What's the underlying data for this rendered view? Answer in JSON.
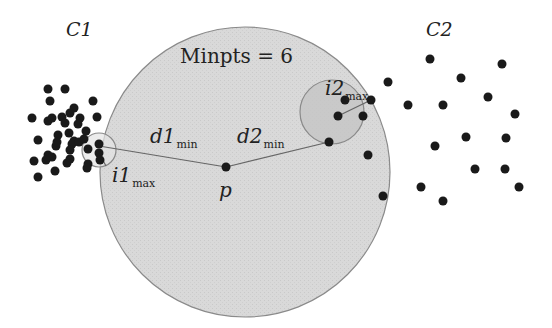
{
  "labels": {
    "cluster1": "C1",
    "cluster2": "C2",
    "minpts": "Minpts = 6",
    "point_p": "p",
    "d1_main": "d1",
    "d1_sub": "min",
    "d2_main": "d2",
    "d2_sub": "min",
    "i1_main": "i1",
    "i1_sub": "max",
    "i2_main": "i2",
    "i2_sub": "max"
  },
  "colors": {
    "big_circle_fill": "#d8d8d8",
    "big_circle_stroke": "#8a8a8a",
    "small_circle_fill": "#c4c4c4",
    "dot": "#1a1a1a",
    "line": "#666666"
  },
  "geometry": {
    "big_circle": {
      "cx": 245,
      "cy": 172,
      "r": 145
    },
    "p": {
      "x": 226,
      "y": 167
    },
    "c1_near": {
      "x": 99,
      "y": 149
    },
    "c2_near": {
      "x": 338,
      "y": 116
    },
    "small_circle_1": {
      "cx": 99,
      "cy": 150,
      "r": 17
    },
    "small_circle_2": {
      "cx": 332,
      "cy": 112,
      "r": 32
    }
  },
  "cluster1_points": [
    [
      48,
      89
    ],
    [
      65,
      89
    ],
    [
      50,
      101
    ],
    [
      93,
      101
    ],
    [
      74,
      108
    ],
    [
      70,
      113
    ],
    [
      62,
      117
    ],
    [
      80,
      118
    ],
    [
      78,
      124
    ],
    [
      32,
      118
    ],
    [
      48,
      121
    ],
    [
      52,
      118
    ],
    [
      65,
      123
    ],
    [
      97,
      117
    ],
    [
      86,
      131
    ],
    [
      58,
      135
    ],
    [
      69,
      133
    ],
    [
      74,
      141
    ],
    [
      72,
      144
    ],
    [
      79,
      142
    ],
    [
      84,
      139
    ],
    [
      56,
      146
    ],
    [
      57,
      142
    ],
    [
      38,
      140
    ],
    [
      70,
      150
    ],
    [
      88,
      149
    ],
    [
      99,
      144
    ],
    [
      99,
      153
    ],
    [
      48,
      155
    ],
    [
      70,
      159
    ],
    [
      52,
      157
    ],
    [
      100,
      160
    ],
    [
      34,
      161
    ],
    [
      67,
      163
    ],
    [
      88,
      164
    ],
    [
      55,
      171
    ],
    [
      38,
      177
    ],
    [
      87,
      168
    ],
    [
      46,
      160
    ]
  ],
  "cluster2_points": [
    [
      430,
      59
    ],
    [
      502,
      64
    ],
    [
      461,
      78
    ],
    [
      388,
      82
    ],
    [
      488,
      97
    ],
    [
      408,
      105
    ],
    [
      443,
      105
    ],
    [
      345,
      100
    ],
    [
      371,
      100
    ],
    [
      515,
      114
    ],
    [
      338,
      116
    ],
    [
      363,
      116
    ],
    [
      466,
      137
    ],
    [
      506,
      138
    ],
    [
      435,
      146
    ],
    [
      329,
      142
    ],
    [
      368,
      155
    ],
    [
      475,
      169
    ],
    [
      505,
      169
    ],
    [
      519,
      187
    ],
    [
      421,
      187
    ],
    [
      383,
      196
    ],
    [
      443,
      201
    ]
  ]
}
